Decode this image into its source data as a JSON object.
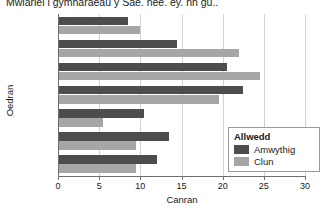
{
  "chart_data": {
    "type": "bar",
    "orientation": "horizontal",
    "title": "Mwiariei i gymharaeau y Sae. nee. ey. nn gu..",
    "xlabel": "Canran",
    "ylabel": "Oedran",
    "categories": [
      "0–9",
      "10–19",
      "20–29",
      "30–44",
      "45–59",
      "60–74",
      "75+"
    ],
    "series": [
      {
        "name": "Amwythig",
        "color": "#4d4d4d",
        "values": [
          12,
          13.5,
          10.5,
          22.5,
          20.5,
          14.5,
          8.5
        ]
      },
      {
        "name": "Clun",
        "color": "#a6a6a6",
        "values": [
          9.5,
          9.5,
          5.5,
          19.5,
          24.5,
          22,
          10
        ]
      }
    ],
    "xlim": [
      0,
      30
    ],
    "xticks": [
      0,
      5,
      10,
      15,
      20,
      25,
      30
    ],
    "grid": "vertical",
    "legend_title": "Allwedd",
    "legend_position": "inside-bottom-right"
  }
}
